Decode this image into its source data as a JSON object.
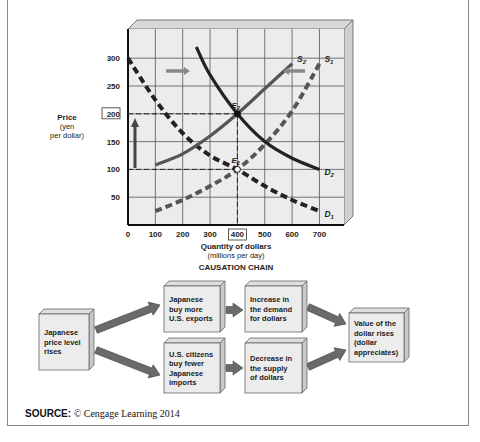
{
  "chart_data": {
    "type": "line",
    "title": "",
    "xlabel": "Quantity of dollars",
    "xlabel_sub": "(millions per day)",
    "ylabel": "Price",
    "ylabel_sub1": "(yen",
    "ylabel_sub2": "per dollar)",
    "xlim": [
      0,
      790
    ],
    "ylim": [
      0,
      355
    ],
    "x_ticks": [
      "0",
      "100",
      "200",
      "300",
      "400",
      "500",
      "600",
      "700"
    ],
    "y_ticks": [
      "50",
      "100",
      "150",
      "200",
      "250",
      "300"
    ],
    "highlighted_x_tick": "400",
    "highlighted_y_tick": "200",
    "grid": true,
    "series": [
      {
        "name": "S1",
        "label": "S",
        "sub": "1",
        "style": "dashed",
        "color": "#555555",
        "x": [
          100,
          200,
          300,
          400,
          500,
          600,
          700
        ],
        "y": [
          25,
          45,
          70,
          100,
          145,
          205,
          290
        ]
      },
      {
        "name": "S2",
        "label": "S",
        "sub": "2",
        "style": "solid",
        "color": "#555555",
        "x": [
          100,
          200,
          300,
          400,
          500,
          600
        ],
        "y": [
          108,
          128,
          160,
          200,
          245,
          290
        ]
      },
      {
        "name": "D1",
        "label": "D",
        "sub": "1",
        "style": "dashed",
        "color": "#222222",
        "x": [
          0,
          100,
          200,
          300,
          400,
          500,
          600,
          700
        ],
        "y": [
          300,
          225,
          165,
          125,
          100,
          70,
          45,
          25
        ]
      },
      {
        "name": "D2",
        "label": "D",
        "sub": "2",
        "style": "solid",
        "color": "#222222",
        "x": [
          250,
          300,
          400,
          500,
          600,
          700
        ],
        "y": [
          320,
          270,
          200,
          150,
          120,
          100
        ]
      }
    ],
    "equilibria": [
      {
        "name": "E1",
        "label": "E",
        "sub": "1",
        "x": 400,
        "y": 100
      },
      {
        "name": "E2",
        "label": "E",
        "sub": "2",
        "x": 400,
        "y": 200
      }
    ],
    "annotations": [
      "Arrow right near top (demand shifts right)",
      "Arrow left near top (supply shifts left)",
      "Arrow up along price axis (price rises from 100 to 200)"
    ]
  },
  "causation": {
    "title": "CAUSATION CHAIN",
    "boxes": [
      {
        "id": "start",
        "lines": [
          "Japanese",
          "price level",
          "rises"
        ]
      },
      {
        "id": "exports",
        "lines": [
          "Japanese",
          "buy more",
          "U.S. exports"
        ]
      },
      {
        "id": "imports",
        "lines": [
          "U.S. citizens",
          "buy fewer",
          "Japanese",
          "imports"
        ]
      },
      {
        "id": "demand",
        "lines": [
          "Increase in",
          "the demand",
          "for dollars"
        ]
      },
      {
        "id": "supply",
        "lines": [
          "Decrease in",
          "the supply",
          "of dollars"
        ]
      },
      {
        "id": "result",
        "lines": [
          "Value of the",
          "dollar rises",
          "(dollar",
          "appreciates)"
        ]
      }
    ]
  },
  "source": {
    "label": "SOURCE:",
    "text": " © Cengage Learning 2014"
  },
  "colors": {
    "grid_bg": "#ececec",
    "grid_line": "#555555",
    "box_face": "#ececec",
    "box_side": "#c8c8c8",
    "arrow": "#6a6a6a"
  }
}
